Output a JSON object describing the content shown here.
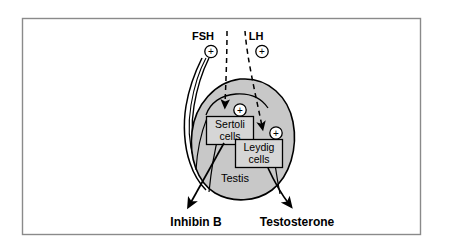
{
  "figure": {
    "frame": {
      "border_color": "#808080",
      "background_color": "#ffffff"
    },
    "colors": {
      "testis_fill": "#c8c8c8",
      "box_fill": "#d6d6d6",
      "outline": "#000000",
      "frame_border": "#8a8a8a"
    }
  },
  "hormones": [
    {
      "id": "fsh",
      "label": "FSH",
      "effect_symbol": "+",
      "effect_symbol_name": "plus-circle-icon",
      "target": "Sertoli cells"
    },
    {
      "id": "lh",
      "label": "LH",
      "effect_symbol": "+",
      "effect_symbol_name": "plus-circle-icon",
      "target": "Leydig cells"
    }
  ],
  "cells": [
    {
      "id": "sertoli",
      "line1": "Sertoli",
      "line2": "cells",
      "effect_symbol": "+",
      "produces": "Inhibin B"
    },
    {
      "id": "leydig",
      "line1": "Leydig",
      "line2": "cells",
      "effect_symbol": "+",
      "produces": "Testosterone"
    }
  ],
  "organ": {
    "label": "Testis"
  },
  "outputs": [
    {
      "id": "inhibin-b",
      "label": "Inhibin B",
      "source": "Sertoli cells"
    },
    {
      "id": "testosterone",
      "label": "Testosterone",
      "source": "Leydig cells"
    }
  ]
}
